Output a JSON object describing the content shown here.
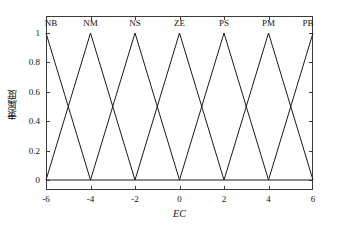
{
  "chart_data": {
    "type": "line",
    "title": "",
    "xlabel": "EC",
    "ylabel": "隶属度",
    "xlim": [
      -6,
      6
    ],
    "ylim": [
      0,
      1
    ],
    "xticks": [
      -6,
      -4,
      -2,
      0,
      2,
      4,
      6
    ],
    "xticklabels": [
      "-6",
      "-4",
      "-2",
      "0",
      "2",
      "4",
      "6"
    ],
    "yticks": [
      0,
      0.2,
      0.4,
      0.6,
      0.8,
      1
    ],
    "yticklabels": [
      "0",
      "0.2",
      "0.4",
      "0.6",
      "0.8",
      "1"
    ],
    "grid": false,
    "legend_position": "none",
    "box": true,
    "tick_direction": "in",
    "line_color": "#1a1a1a",
    "series": [
      {
        "name": "NB",
        "label_x": -6,
        "type": "triangular_mf",
        "params": [
          -8,
          -6,
          -4
        ],
        "x": [
          -8,
          -6,
          -4
        ],
        "values": [
          0,
          1,
          0
        ]
      },
      {
        "name": "NM",
        "label_x": -4,
        "type": "triangular_mf",
        "params": [
          -6,
          -4,
          -2
        ],
        "x": [
          -6,
          -4,
          -2
        ],
        "values": [
          0,
          1,
          0
        ]
      },
      {
        "name": "NS",
        "label_x": -2,
        "type": "triangular_mf",
        "params": [
          -4,
          -2,
          0
        ],
        "x": [
          -4,
          -2,
          0
        ],
        "values": [
          0,
          1,
          0
        ]
      },
      {
        "name": "ZE",
        "label_x": 0,
        "type": "triangular_mf",
        "params": [
          -2,
          0,
          2
        ],
        "x": [
          -2,
          0,
          2
        ],
        "values": [
          0,
          1,
          0
        ]
      },
      {
        "name": "PS",
        "label_x": 2,
        "type": "triangular_mf",
        "params": [
          0,
          2,
          4
        ],
        "x": [
          0,
          2,
          4
        ],
        "values": [
          0,
          1,
          0
        ]
      },
      {
        "name": "PM",
        "label_x": 4,
        "type": "triangular_mf",
        "params": [
          2,
          4,
          6
        ],
        "x": [
          2,
          4,
          6
        ],
        "values": [
          0,
          1,
          0
        ]
      },
      {
        "name": "PB",
        "label_x": 6,
        "type": "triangular_mf",
        "params": [
          4,
          6,
          8
        ],
        "x": [
          4,
          6,
          8
        ],
        "values": [
          0,
          1,
          0
        ]
      }
    ],
    "crossings": [
      {
        "x": -5,
        "y": 0.5
      },
      {
        "x": -3,
        "y": 0.5
      },
      {
        "x": -1,
        "y": 0.5
      },
      {
        "x": 1,
        "y": 0.5
      },
      {
        "x": 3,
        "y": 0.5
      },
      {
        "x": 5,
        "y": 0.5
      }
    ],
    "annotations": [
      {
        "text": "NB",
        "x": -6,
        "y": 1.07
      },
      {
        "text": "NM",
        "x": -4,
        "y": 1.07
      },
      {
        "text": "NS",
        "x": -2,
        "y": 1.07
      },
      {
        "text": "ZE",
        "x": 0,
        "y": 1.07
      },
      {
        "text": "PS",
        "x": 2,
        "y": 1.07
      },
      {
        "text": "PM",
        "x": 4,
        "y": 1.07
      },
      {
        "text": "PB",
        "x": 6,
        "y": 1.07
      }
    ]
  }
}
